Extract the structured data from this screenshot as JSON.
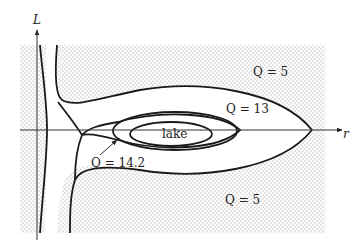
{
  "diagram": {
    "axes": {
      "vertical_label": "L",
      "horizontal_label": "r"
    },
    "regions": {
      "lake_label": "lake"
    },
    "contours": [
      {
        "label": "Q = 5",
        "position": "upper-right"
      },
      {
        "label": "Q = 13",
        "position": "middle"
      },
      {
        "label": "Q = 14.2",
        "position": "lower-left",
        "has_arrow": true
      },
      {
        "label": "Q = 5",
        "position": "lower-right"
      }
    ],
    "colors": {
      "stipple": "#9a9a9a",
      "line": "#1a1a1a",
      "background": "#ffffff"
    }
  }
}
